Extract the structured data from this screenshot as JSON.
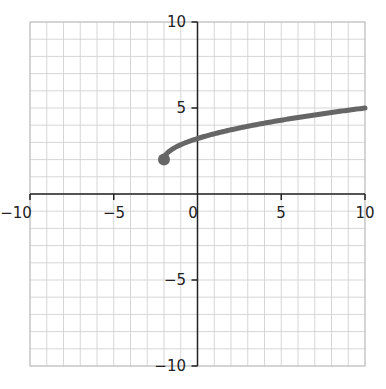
{
  "chart_data": {
    "type": "line",
    "title": "",
    "xlabel": "",
    "ylabel": "",
    "xlim": [
      -10,
      10
    ],
    "ylim": [
      -10,
      10
    ],
    "grid": true,
    "x_ticks": [
      "-10",
      "-5",
      "0",
      "5",
      "10"
    ],
    "y_ticks": [
      "-10",
      "-5",
      "5",
      "10"
    ],
    "series": [
      {
        "name": "square-root curve",
        "color": "#666666",
        "start_point": {
          "x": -2,
          "y": 2,
          "marker": "filled-circle"
        },
        "x": [
          -2,
          -1.5,
          -1,
          0,
          1,
          2,
          3,
          4,
          5,
          6,
          7,
          8,
          9,
          10
        ],
        "y": [
          2,
          2.61,
          2.87,
          3.22,
          3.5,
          3.73,
          3.94,
          4.12,
          4.29,
          4.45,
          4.6,
          4.74,
          4.87,
          5.0
        ]
      }
    ]
  },
  "labels": {
    "x_neg10": "−10",
    "x_neg5": "−5",
    "x_0": "0",
    "x_5": "5",
    "x_10": "10",
    "y_10": "10",
    "y_5": "5",
    "y_neg5": "−5",
    "y_neg10": "−10"
  }
}
